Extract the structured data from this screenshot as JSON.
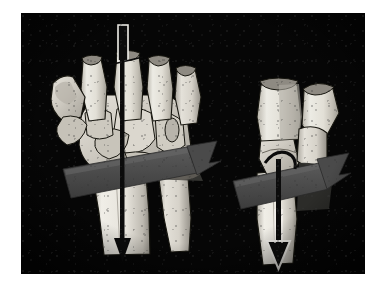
{
  "document": {
    "page_background": "#ffffff",
    "figure": {
      "panel_background": "#050505",
      "panel_bounds": {
        "x": 21,
        "y": 13,
        "width": 344,
        "height": 261
      },
      "type": "anatomical-illustration",
      "subject": "wrist-traction-distraction-technique",
      "modality": "grayscale-halftone-photograph-of-illustration",
      "views": [
        {
          "id": "left-view",
          "name": "palmar-dorsal-view-of-hand-and-distal-forearm",
          "elements": [
            {
              "name": "thumb-metacarpal",
              "tone": "#d9d6ce"
            },
            {
              "name": "trapezium-bone",
              "tone": "#cfccc3"
            },
            {
              "name": "scaphoid-bone",
              "tone": "#c9c5bb"
            },
            {
              "name": "lunate-bone",
              "tone": "#c4c0b6"
            },
            {
              "name": "capitate-bone",
              "tone": "#d2cec5"
            },
            {
              "name": "hamate-bone",
              "tone": "#cbc7bd"
            },
            {
              "name": "metacarpal-two",
              "tone": "#e3e0d8"
            },
            {
              "name": "metacarpal-three",
              "tone": "#e6e3db"
            },
            {
              "name": "metacarpal-four",
              "tone": "#ded9d0"
            },
            {
              "name": "metacarpal-five",
              "tone": "#d7d3c9"
            },
            {
              "name": "distal-radius",
              "tone": "#eae7df"
            },
            {
              "name": "distal-ulna",
              "tone": "#ddd9d0"
            },
            {
              "name": "traction-band",
              "tone": "#4d4d4d"
            },
            {
              "name": "traction-band-arrowhead",
              "tone": "#4a4a4a"
            },
            {
              "name": "longitudinal-traction-arrow",
              "tone": "#0d0d0d"
            },
            {
              "name": "arrow-tail-rod",
              "tone": "#f2f0ea"
            }
          ]
        },
        {
          "id": "right-view",
          "name": "lateral-view-of-wrist-and-distal-forearm",
          "elements": [
            {
              "name": "proximal-phalanx-fork",
              "tone": "#e8e5dd"
            },
            {
              "name": "metacarpal-lateral",
              "tone": "#dcd8cf"
            },
            {
              "name": "carpal-row-lateral",
              "tone": "#cfcbc2"
            },
            {
              "name": "distal-radius-lateral",
              "tone": "#eceae2"
            },
            {
              "name": "traction-band",
              "tone": "#4d4d4d"
            },
            {
              "name": "traction-band-arrowhead",
              "tone": "#4a4a4a"
            },
            {
              "name": "longitudinal-traction-arrow",
              "tone": "#0d0d0d"
            },
            {
              "name": "arrow-head-outline",
              "tone": "#f5f3ee"
            }
          ]
        }
      ]
    }
  },
  "colors": {
    "page": "#ffffff",
    "panel": "#050505",
    "bone_light": "#ece9e1",
    "bone_mid": "#d3cfc6",
    "bone_shadow": "#a8a49b",
    "bone_outline": "#1a1a1a",
    "band_gray": "#4d4d4d",
    "band_gray_light": "#5c5c5c",
    "arrow_black": "#0d0d0d",
    "arrow_white": "#f5f3ee"
  },
  "labels": {
    "caption": "",
    "figure_number": "",
    "annotations": []
  }
}
